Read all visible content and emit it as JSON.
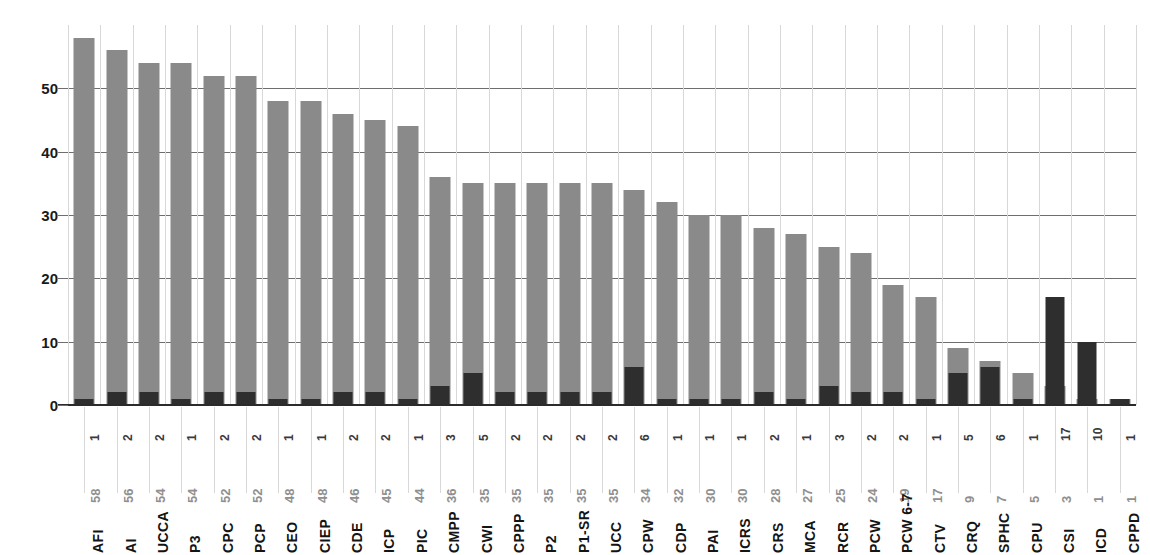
{
  "chart_data": {
    "type": "bar",
    "title": "",
    "subtitle": "",
    "xlabel": "",
    "ylabel": "",
    "ylim": [
      0,
      60
    ],
    "yticks": [
      0,
      10,
      20,
      30,
      40,
      50
    ],
    "grid": "horizontal-and-vertical",
    "legend": "none",
    "stacked": false,
    "overlap": "count-bars-drawn-in-front-of-total-bars",
    "colors": {
      "total_bar": "#8a8a8a",
      "count_bar": "#2e2e2e",
      "horizontal_gridline": "#6e6e6e",
      "vertical_gridline": "#d8d8d8",
      "axis_line": "#2b2b2b",
      "tick_text": "#1a1a1a",
      "total_label_text": "#8f8f8f",
      "count_label_text": "#3a3a3a",
      "background": "#ffffff"
    },
    "categories": [
      "AFI",
      "AI",
      "UCCA",
      "P3",
      "CPC",
      "PCP",
      "CEO",
      "CIEP",
      "CDE",
      "ICP",
      "PIC",
      "CMPP",
      "CWI",
      "CPPP",
      "P2",
      "P1-SR",
      "UCC",
      "CPW",
      "CDP",
      "PAI",
      "ICRS",
      "CRS",
      "MCA",
      "RCR",
      "PCW",
      "PCW 6-7",
      "CTV",
      "CRQ",
      "SPHC",
      "CPU",
      "CSI",
      "ICD",
      "CPPD"
    ],
    "series": [
      {
        "name": "total",
        "color": "#8a8a8a",
        "values": [
          58,
          56,
          54,
          54,
          52,
          52,
          48,
          48,
          46,
          45,
          44,
          36,
          35,
          35,
          35,
          35,
          35,
          34,
          32,
          30,
          30,
          28,
          27,
          25,
          24,
          19,
          17,
          9,
          7,
          5,
          3,
          1,
          1
        ]
      },
      {
        "name": "count",
        "color": "#2e2e2e",
        "values": [
          1,
          2,
          2,
          1,
          2,
          2,
          1,
          1,
          2,
          2,
          1,
          3,
          5,
          2,
          2,
          2,
          2,
          6,
          1,
          1,
          1,
          2,
          1,
          3,
          2,
          2,
          1,
          5,
          6,
          1,
          17,
          10,
          1
        ]
      }
    ]
  }
}
